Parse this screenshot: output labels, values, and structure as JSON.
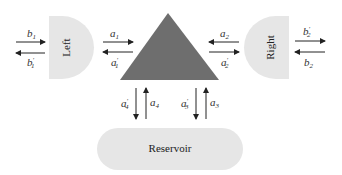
{
  "diagram": {
    "type": "scattering-network",
    "colors": {
      "region_fill": "#e6e6e6",
      "scatterer_fill": "#6e6e6e",
      "arrow": "#222222",
      "text": "#333333"
    },
    "nodes": {
      "left": {
        "label": "Left"
      },
      "right": {
        "label": "Right"
      },
      "reservoir": {
        "label": "Reservoir"
      },
      "scatterer": {
        "shape": "triangle"
      }
    },
    "arrows": {
      "b1": {
        "base": "b",
        "sub": "1",
        "prime": "",
        "direction": "into Left"
      },
      "b1p": {
        "base": "b",
        "sub": "1",
        "prime": "′",
        "direction": "out of Left"
      },
      "a1": {
        "base": "a",
        "sub": "1",
        "prime": "",
        "direction": "into scatterer from left"
      },
      "a1p": {
        "base": "a",
        "sub": "1",
        "prime": "′",
        "direction": "out of scatterer to left"
      },
      "a2": {
        "base": "a",
        "sub": "2",
        "prime": "",
        "direction": "into scatterer from right"
      },
      "a2p": {
        "base": "a",
        "sub": "2",
        "prime": "′",
        "direction": "out of scatterer to right"
      },
      "b2p": {
        "base": "b",
        "sub": "2",
        "prime": "′",
        "direction": "out of Right"
      },
      "b2": {
        "base": "b",
        "sub": "2",
        "prime": "",
        "direction": "into Right"
      },
      "a4p": {
        "base": "a",
        "sub": "4",
        "prime": "′",
        "direction": "down to reservoir"
      },
      "a4": {
        "base": "a",
        "sub": "4",
        "prime": "",
        "direction": "up from reservoir"
      },
      "a3p": {
        "base": "a",
        "sub": "3",
        "prime": "′",
        "direction": "down to reservoir"
      },
      "a3": {
        "base": "a",
        "sub": "3",
        "prime": "",
        "direction": "up from reservoir"
      }
    }
  }
}
